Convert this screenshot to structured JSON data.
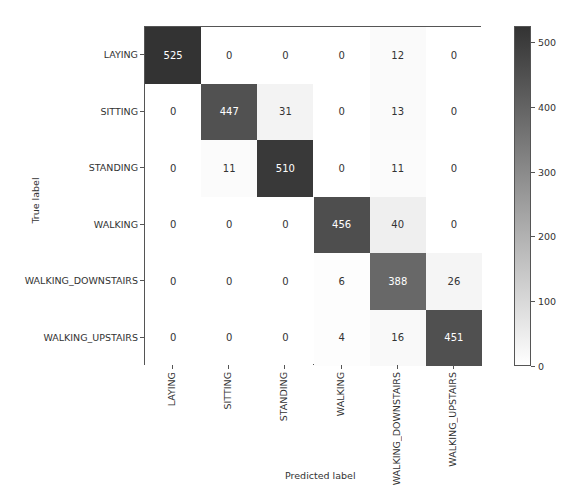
{
  "chart_data": {
    "type": "heatmap",
    "title": "",
    "xlabel": "Predicted label",
    "ylabel": "True label",
    "x_categories": [
      "LAYING",
      "SITTING",
      "STANDING",
      "WALKING",
      "WALKING_DOWNSTAIRS",
      "WALKING_UPSTAIRS"
    ],
    "y_categories": [
      "LAYING",
      "SITTING",
      "STANDING",
      "WALKING",
      "WALKING_DOWNSTAIRS",
      "WALKING_UPSTAIRS"
    ],
    "values": [
      [
        525,
        0,
        0,
        0,
        12,
        0
      ],
      [
        0,
        447,
        31,
        0,
        13,
        0
      ],
      [
        0,
        11,
        510,
        0,
        11,
        0
      ],
      [
        0,
        0,
        0,
        456,
        40,
        0
      ],
      [
        0,
        0,
        0,
        6,
        388,
        26
      ],
      [
        0,
        0,
        0,
        4,
        16,
        451
      ]
    ],
    "colorbar": {
      "ticks": [
        0,
        100,
        200,
        300,
        400,
        500
      ],
      "range": [
        0,
        525
      ],
      "colormap": "Greys",
      "low_color": "#ffffff",
      "high_color": "#333333"
    }
  }
}
